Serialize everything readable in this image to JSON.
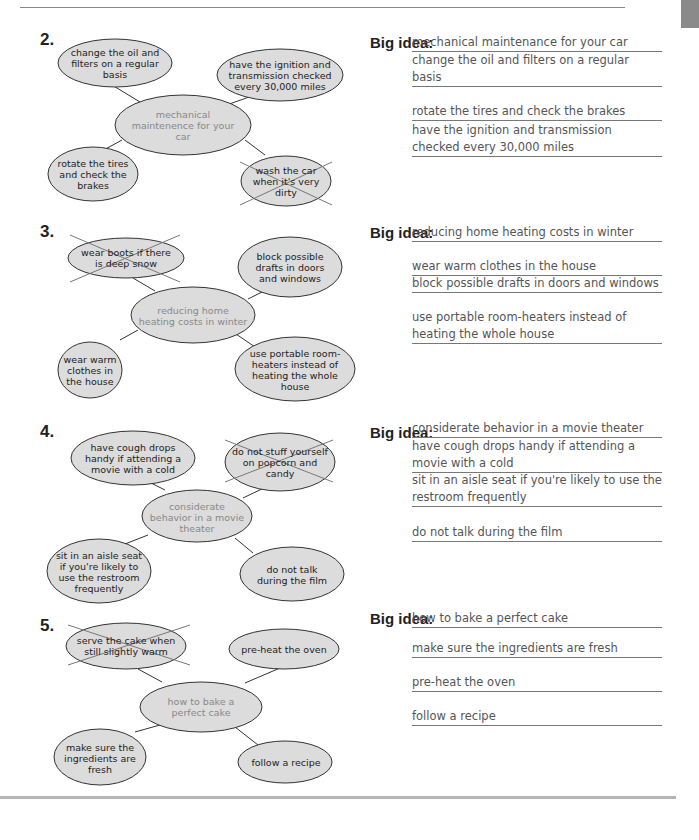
{
  "page": {
    "big_idea_label": "Big idea:"
  },
  "exercises": [
    {
      "number": "2.",
      "center": "mechanical maintenence for your car",
      "nodes": {
        "top_left": "change the oil and filters on a regular basis",
        "top_right": "have the ignition and transmission checked every 30,000 miles",
        "bottom_left": "rotate the tires and check the brakes",
        "bottom_right": "wash the car when it's very dirty"
      },
      "crossed_out": "bottom_right",
      "big_idea": "mechanical maintenance for your car",
      "answers": [
        "change the oil and filters on a regular basis",
        "rotate the tires and check the brakes",
        "have the ignition and transmission checked every 30,000 miles"
      ]
    },
    {
      "number": "3.",
      "center": "reducing home heating costs in winter",
      "nodes": {
        "top_left": "wear boots if there is deep snow",
        "top_right": "block possible drafts in doors and windows",
        "bottom_left": "wear warm clothes in the house",
        "bottom_right": "use portable room-heaters instead of heating the whole house"
      },
      "crossed_out": "top_left",
      "big_idea": "reducing home heating costs in winter",
      "answers": [
        "wear warm clothes in the house",
        "block possible drafts in doors and windows",
        "use portable room-heaters instead of heating the whole house"
      ]
    },
    {
      "number": "4.",
      "center": "considerate behavior in a movie theater",
      "nodes": {
        "top_left": "have cough drops handy if attending a movie with a cold",
        "top_right": "do not stuff yourself on popcorn and candy",
        "bottom_left": "sit in an aisle seat if you're likely to use the restroom frequently",
        "bottom_right": "do not talk during the film"
      },
      "crossed_out": "top_right",
      "big_idea": "considerate behavior in a movie theater",
      "answers": [
        "have cough drops handy if attending a movie with a cold",
        "sit in an aisle seat if you're likely to use the restroom frequently",
        "do not talk during the film"
      ]
    },
    {
      "number": "5.",
      "center": "how to bake a perfect cake",
      "nodes": {
        "top_left": "serve the cake when still slightly warm",
        "top_right": "pre-heat the oven",
        "bottom_left": "make sure the ingredients are fresh",
        "bottom_right": "follow a recipe"
      },
      "crossed_out": "top_left",
      "big_idea": "how to bake a perfect cake",
      "answers": [
        "make sure the ingredients are fresh",
        "pre-heat the oven",
        "follow a recipe"
      ]
    }
  ]
}
